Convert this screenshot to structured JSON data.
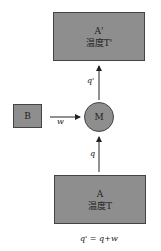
{
  "diagram": {
    "top_box": {
      "name": "A'",
      "temp_label": "温度T'"
    },
    "bottom_box": {
      "name": "A",
      "temp_label": "温度T"
    },
    "side_box": {
      "name": "B"
    },
    "machine": {
      "name": "M"
    },
    "arrows": {
      "heat_out": "q'",
      "heat_in": "q",
      "work_in": "w"
    },
    "equation": "q' = q+w",
    "colors": {
      "fill": "#8e8e8e",
      "stroke": "#444444"
    }
  }
}
